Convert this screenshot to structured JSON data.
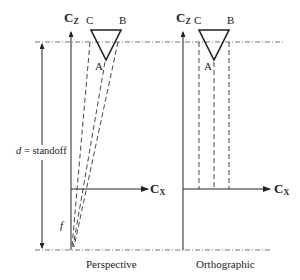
{
  "diagram": {
    "colors": {
      "stroke": "#222222",
      "dash": "#333333",
      "background": "#ffffff"
    },
    "perspective": {
      "caption": "Perspective",
      "axis_z_label": "C",
      "axis_z_sub": "Z",
      "axis_x_label": "C",
      "axis_x_sub": "X",
      "vertices": {
        "a": "A",
        "b": "B",
        "c": "C"
      },
      "standoff_label_var": "d",
      "standoff_label_eq": " = standoff",
      "focal_label": "f"
    },
    "orthographic": {
      "caption": "Orthographic",
      "axis_z_label": "C",
      "axis_z_sub": "Z",
      "axis_x_label": "C",
      "axis_x_sub": "X",
      "vertices": {
        "a": "A",
        "b": "B",
        "c": "C"
      }
    }
  }
}
